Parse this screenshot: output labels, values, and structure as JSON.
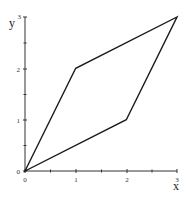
{
  "chart_data": {
    "type": "line",
    "title": "",
    "xlabel": "x",
    "ylabel": "y",
    "xlim": [
      0,
      3
    ],
    "ylim": [
      0,
      3
    ],
    "grid": false,
    "legend": null,
    "x_ticks": [
      "0",
      "1",
      "2",
      "3"
    ],
    "y_ticks": [
      "0",
      "1",
      "2",
      "3"
    ],
    "series": [
      {
        "name": "parallelogram",
        "closed": true,
        "points": [
          [
            0,
            0
          ],
          [
            1,
            2
          ],
          [
            3,
            3
          ],
          [
            2,
            1
          ]
        ]
      }
    ]
  },
  "labels": {
    "x_axis": "x",
    "y_axis": "y",
    "x_tick_0": "0",
    "x_tick_1": "1",
    "x_tick_2": "2",
    "x_tick_3": "3",
    "y_tick_0": "0",
    "y_tick_1": "1",
    "y_tick_2": "2",
    "y_tick_3": "3"
  }
}
